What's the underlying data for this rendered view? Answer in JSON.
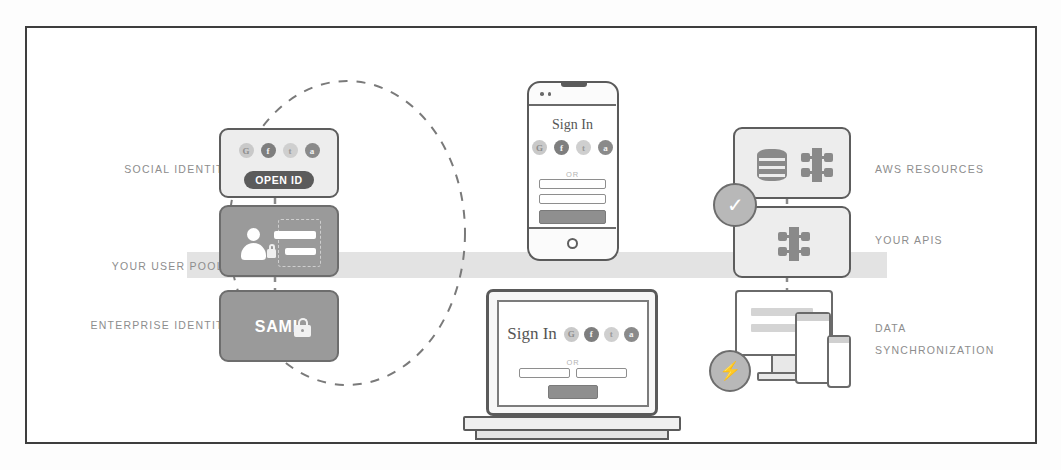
{
  "diagram": {
    "palette": {
      "border": "#3e3e3e",
      "card_light": "#ededed",
      "card_dark": "#9a9a9a",
      "stroke": "#5d5d5d",
      "band": "#dedede",
      "label_text": "#8d8d8d",
      "dark_pill": "#5b5b5b",
      "badge_fill": "#b8b8b8"
    }
  },
  "left_labels": [
    {
      "id": "social-identity",
      "text": "SOCIAL IDENTITY"
    },
    {
      "id": "your-user-pools",
      "text": "YOUR USER POOLS"
    },
    {
      "id": "enterprise-identity",
      "text": "ENTERPRISE IDENTITY"
    }
  ],
  "right_labels": [
    {
      "id": "aws-resources",
      "line1": "AWS RESOURCES",
      "line2": ""
    },
    {
      "id": "your-apis",
      "line1": "YOUR APIS",
      "line2": ""
    },
    {
      "id": "data-synchronization",
      "line1": "DATA",
      "line2": "SYNCHRONIZATION"
    }
  ],
  "left_cards": {
    "social": {
      "name": "social-identity-card",
      "style": "light",
      "pill_label": "OPEN ID",
      "provider_icons": [
        {
          "name": "google-icon",
          "glyph": "G"
        },
        {
          "name": "facebook-icon",
          "glyph": "f"
        },
        {
          "name": "twitter-icon",
          "glyph": "t"
        },
        {
          "name": "amazon-icon",
          "glyph": "a"
        }
      ]
    },
    "user_pools": {
      "name": "user-pools-card",
      "style": "dark",
      "icon": "user-directory-icon"
    },
    "enterprise": {
      "name": "enterprise-identity-card",
      "style": "dark",
      "label": "SAML",
      "icon": "padlock-icon"
    }
  },
  "phone": {
    "name": "phone-mockup",
    "heading": "Sign In",
    "divider": "OR",
    "provider_icons": [
      {
        "name": "google-icon",
        "glyph": "G"
      },
      {
        "name": "facebook-icon",
        "glyph": "f"
      },
      {
        "name": "twitter-icon",
        "glyph": "t"
      },
      {
        "name": "amazon-icon",
        "glyph": "a"
      }
    ],
    "fields": [
      {
        "name": "username-field",
        "value": ""
      },
      {
        "name": "password-field",
        "value": ""
      }
    ],
    "submit_label": ""
  },
  "laptop": {
    "name": "laptop-mockup",
    "heading": "Sign In",
    "divider": "OR",
    "provider_icons": [
      {
        "name": "google-icon",
        "glyph": "G"
      },
      {
        "name": "facebook-icon",
        "glyph": "f"
      },
      {
        "name": "twitter-icon",
        "glyph": "t"
      },
      {
        "name": "amazon-icon",
        "glyph": "a"
      }
    ],
    "fields": [
      {
        "name": "username-field",
        "value": ""
      },
      {
        "name": "password-field",
        "value": ""
      }
    ],
    "submit_label": ""
  },
  "right_cards": {
    "aws_resources": {
      "name": "aws-resources-card",
      "icons": [
        {
          "name": "database-icon"
        },
        {
          "name": "aws-service-icon"
        }
      ]
    },
    "your_apis": {
      "name": "your-apis-card",
      "icons": [
        {
          "name": "api-gateway-icon"
        }
      ]
    },
    "data_sync": {
      "name": "data-synchronization-group",
      "devices": [
        {
          "name": "desktop-monitor-icon"
        },
        {
          "name": "tablet-icon"
        },
        {
          "name": "smartphone-icon"
        }
      ]
    }
  },
  "badges": [
    {
      "id": "auth-check-badge",
      "name": "check-badge",
      "glyph": "✓"
    },
    {
      "id": "sync-bolt-badge",
      "name": "lightning-bolt-badge",
      "glyph": "⚡"
    }
  ]
}
